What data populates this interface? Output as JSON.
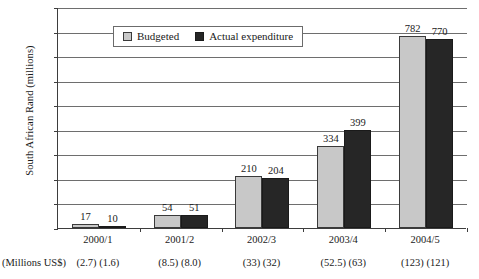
{
  "chart_data": {
    "type": "bar",
    "title": "",
    "subtitle": "",
    "xlabel": "",
    "ylabel": "South African Rand (millions)",
    "ylim": [
      0,
      900
    ],
    "ytick_step": 100,
    "yticks": [
      0,
      100,
      200,
      300,
      400,
      500,
      600,
      700,
      800,
      900
    ],
    "grid": true,
    "legend_position": "top-center-inside",
    "categories": [
      "2000/1",
      "2001/2",
      "2002/3",
      "2003/4",
      "2004/5"
    ],
    "series": [
      {
        "name": "Budgeted",
        "color": "#c8c8c8",
        "values": [
          17,
          54,
          210,
          334,
          782
        ],
        "usd_millions": [
          "(2.7)",
          "(8.5)",
          "(33)",
          "(52.5)",
          "(123)"
        ]
      },
      {
        "name": "Actual expenditure",
        "color": "#262626",
        "values": [
          10,
          51,
          204,
          399,
          770
        ],
        "usd_millions": [
          "(1.6)",
          "(8.0)",
          "(32)",
          "(63)",
          "(121)"
        ]
      }
    ],
    "annotations": {
      "usd_caption": "(Millions US$)"
    }
  },
  "legend": {
    "items": [
      {
        "label": "Budgeted"
      },
      {
        "label": "Actual expenditure"
      }
    ]
  },
  "axes": {
    "y_title": "South African Rand (millions)",
    "y_labels": [
      "900",
      "800",
      "700",
      "600",
      "500",
      "400",
      "300",
      "200",
      "100",
      "0"
    ],
    "x_labels": [
      "2000/1",
      "2001/2",
      "2002/3",
      "2003/4",
      "2004/5"
    ]
  },
  "footnote": {
    "caption": "(Millions US$)",
    "pairs": [
      "(2.7) (1.6)",
      "(8.5) (8.0)",
      "(33) (32)",
      "(52.5) (63)",
      "(123) (121)"
    ]
  },
  "bar_labels": {
    "g0": [
      "17",
      "10"
    ],
    "g1": [
      "54",
      "51"
    ],
    "g2": [
      "210",
      "204"
    ],
    "g3": [
      "334",
      "399"
    ],
    "g4": [
      "782",
      "770"
    ]
  }
}
